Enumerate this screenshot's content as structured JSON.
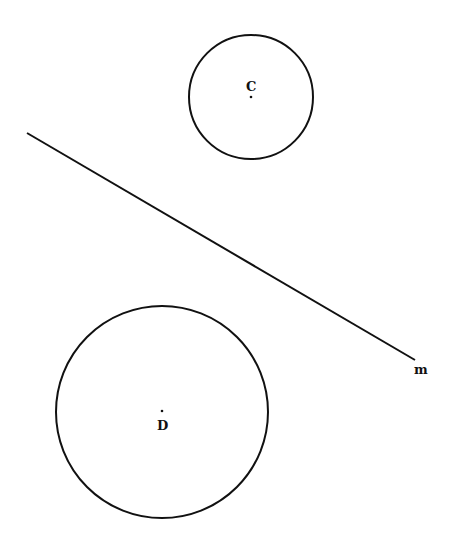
{
  "diagram": {
    "circles": [
      {
        "label": "C",
        "cx": 251,
        "cy": 97,
        "r": 62
      },
      {
        "label": "D",
        "cx": 162,
        "cy": 412,
        "r": 106
      }
    ],
    "line": {
      "label": "m",
      "x1": 27,
      "y1": 133,
      "x2": 415,
      "y2": 360
    },
    "colors": {
      "stroke": "#111111",
      "background": "#ffffff"
    }
  }
}
